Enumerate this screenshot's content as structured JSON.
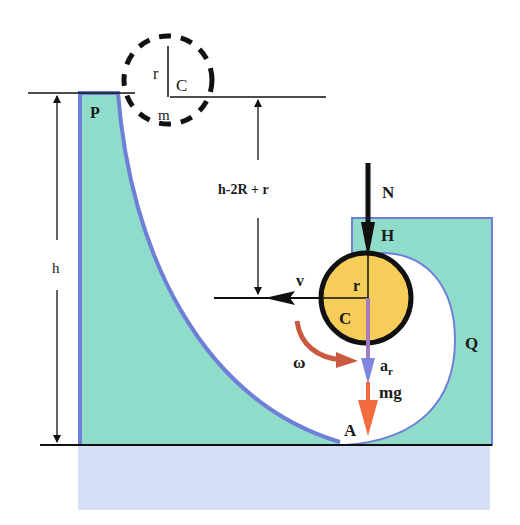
{
  "diagram": {
    "colors": {
      "track_fill": "#8fdccb",
      "track_edge": "#6f7fd8",
      "base_fill": "#d7def7",
      "ball_fill": "#f7cd5a",
      "ball_edge": "#111111",
      "gravity_arrow": "#f26a3d",
      "accel_arrow": "#7f86e0",
      "omega_arrow": "#c95a40",
      "line": "#111111"
    },
    "labels": {
      "point_P": "P",
      "point_H": "H",
      "point_Q": "Q",
      "point_A": "A",
      "height_h": "h",
      "height_drop": "h-2R + r",
      "normal_force": "N",
      "velocity": "v",
      "angular_velocity": "ω",
      "radial_accel": "a",
      "radial_accel_sub": "r",
      "gravity": "mg",
      "ball_radius": "r",
      "ball_center": "C",
      "initial_radius": "r",
      "initial_center": "C",
      "initial_mass": "m"
    }
  }
}
